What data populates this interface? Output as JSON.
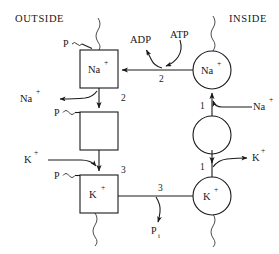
{
  "diagram": {
    "compartments": {
      "left_label": "OUTSIDE",
      "right_label": "INSIDE"
    },
    "membrane": {
      "style": "wavy-vertical-lines",
      "color": "#3a3a3a"
    },
    "outside_states": [
      {
        "id": "outside-na-box",
        "shape": "square",
        "label": "Na",
        "charge": "+",
        "phosphate_label": "P",
        "phosphate_bond": "~"
      },
      {
        "id": "outside-empty-box",
        "shape": "square",
        "label": "",
        "charge": "",
        "phosphate_label": "P",
        "phosphate_bond": "~"
      },
      {
        "id": "outside-k-box",
        "shape": "square",
        "label": "K",
        "charge": "+",
        "phosphate_label": "P",
        "phosphate_bond": "~"
      }
    ],
    "inside_states": [
      {
        "id": "inside-na-circle",
        "shape": "circle",
        "label": "Na",
        "charge": "+"
      },
      {
        "id": "inside-empty-circle",
        "shape": "circle",
        "label": "",
        "charge": ""
      },
      {
        "id": "inside-k-circle",
        "shape": "circle",
        "label": "K",
        "charge": "+"
      }
    ],
    "molecules": {
      "adp": "ADP",
      "atp": "ATP",
      "pi_symbol": "P",
      "pi_subscript": "i"
    },
    "ions": {
      "na": "Na",
      "k": "K",
      "charge": "+"
    },
    "stoichiometry": {
      "na_transport_top": "2",
      "atp_hydrolysis": "2",
      "na_uptake": "1",
      "k_release": "1",
      "k_transport": "3",
      "pi_release": "3"
    },
    "flux_labels": {
      "na_efflux": "Na",
      "na_influx": "Na",
      "k_influx": "K",
      "k_efflux": "K"
    }
  }
}
